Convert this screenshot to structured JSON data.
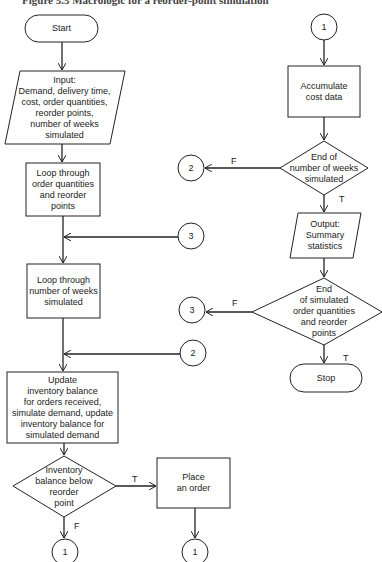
{
  "caption": "Figure 5.5   Macrologic for a reorder-point simulation",
  "nodes": {
    "start": "Start",
    "input": "Input:\nDemand, delivery time,\ncost, order quantities,\nreorder points,\nnumber of weeks\nsimulated",
    "loop_orders": "Loop through\norder quantities\nand reorder\npoints",
    "loop_weeks": "Loop through\nnumber of weeks\nsimulated",
    "update": "Update\ninventory balance\nfor orders received,\nsimulate demand, update\ninventory balance for\nsimulated demand",
    "decision_reorder": "Inventory\nbalance below\nreorder\npoint",
    "place_order": "Place\nan order",
    "accumulate": "Accumulate\ncost data",
    "decision_weeks": "End of\nnumber of weeks\nsimulated",
    "output": "Output:\nSummary\nstatistics",
    "decision_orders": "End\nof simulated\norder quantities\nand reorder\npoints",
    "stop": "Stop"
  },
  "connectors": {
    "c1_top": "1",
    "c2_from_weeks": "2",
    "c3_to_loop": "3",
    "c3_from_orders": "3",
    "c2_to_update": "2",
    "c1_false": "1",
    "c1_place": "1"
  },
  "flags": {
    "reorder_true": "T",
    "reorder_false": "F",
    "weeks_false": "F",
    "weeks_true": "T",
    "orders_false": "F",
    "orders_true": "T"
  }
}
